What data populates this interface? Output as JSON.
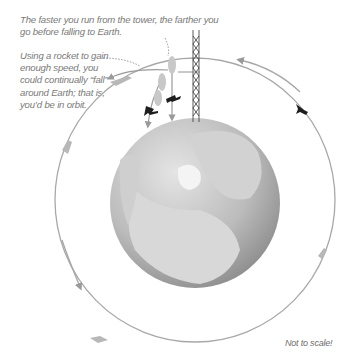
{
  "captions": {
    "top": "The faster you run from the tower, the farther you go before falling to Earth.",
    "rocket": "Using a rocket to gain enough speed, you could continually “fall” around Earth; that is, you’d be in orbit.",
    "scale_note": "Not to scale!"
  },
  "colors": {
    "orbit_line": "#9a9a9a",
    "globe_dark": "#8c8c8c",
    "globe_light": "#d6d6d6",
    "text": "#7a7a7a",
    "figure": "#1e1e1e"
  },
  "elements": {
    "tower": "radio-tower",
    "globe": "earth-globe-north-polar-view",
    "orbit": "circular-orbit-path",
    "figures": [
      "running-person-ghosts",
      "falling-person",
      "falling-person",
      "orbiting-person"
    ]
  }
}
